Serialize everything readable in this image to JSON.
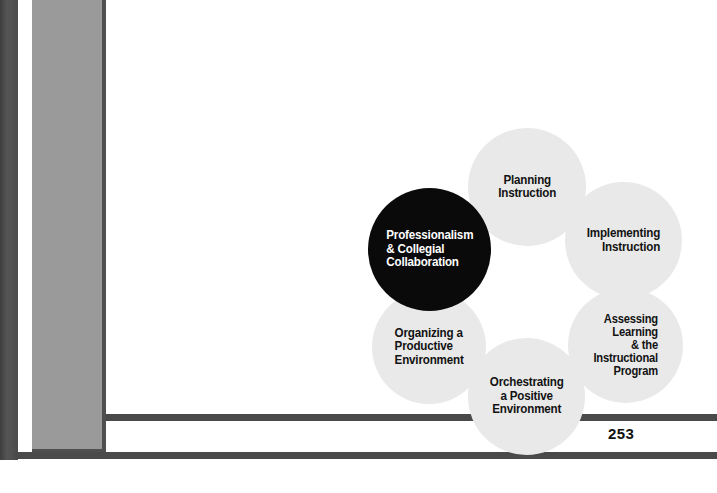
{
  "page": {
    "folio": "253",
    "background_color": "#ffffff",
    "rule_color": "#4a4a4a",
    "sidebar_color": "#9a9a9a",
    "binding_color": "#4a4a4a"
  },
  "diagram": {
    "type": "cycle",
    "node_fill": "#e9e9e9",
    "highlight_fill": "#0a0a0a",
    "highlight_text_color": "#ffffff",
    "text_color": "#121212",
    "nodes": [
      {
        "id": "professionalism",
        "label": "Professionalism\n& Collegial\nCollaboration",
        "highlighted": true
      },
      {
        "id": "planning",
        "label": "Planning\nInstruction",
        "highlighted": false
      },
      {
        "id": "implementing",
        "label": "Implementing\nInstruction",
        "highlighted": false
      },
      {
        "id": "assessing",
        "label": "Assessing\nLearning\n& the\nInstructional\nProgram",
        "highlighted": false
      },
      {
        "id": "orchestrating",
        "label": "Orchestrating\na Positive\nEnvironment",
        "highlighted": false
      },
      {
        "id": "organizing",
        "label": "Organizing a\nProductive\nEnvironment",
        "highlighted": false
      }
    ]
  }
}
